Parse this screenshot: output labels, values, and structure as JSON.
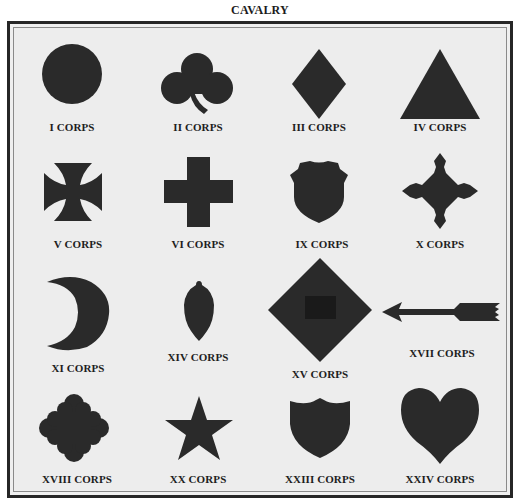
{
  "caption": "CAVALRY",
  "colors": {
    "badge_fill": "#2a2a2a",
    "background": "#ededed",
    "frame": "#262626"
  },
  "badges": [
    {
      "label": "I CORPS",
      "shape": "circle"
    },
    {
      "label": "II CORPS",
      "shape": "trefoil-club"
    },
    {
      "label": "III CORPS",
      "shape": "diamond"
    },
    {
      "label": "IV CORPS",
      "shape": "triangle"
    },
    {
      "label": "V CORPS",
      "shape": "maltese-cross"
    },
    {
      "label": "VI CORPS",
      "shape": "greek-cross"
    },
    {
      "label": "IX CORPS",
      "shape": "shield-badge"
    },
    {
      "label": "X CORPS",
      "shape": "four-pointed-cross"
    },
    {
      "label": "XI CORPS",
      "shape": "crescent"
    },
    {
      "label": "XIV CORPS",
      "shape": "acorn"
    },
    {
      "label": "XV CORPS",
      "shape": "diamond-with-cartridge-box"
    },
    {
      "label": "XVII CORPS",
      "shape": "arrow"
    },
    {
      "label": "XVIII CORPS",
      "shape": "cross-with-foliated-arms"
    },
    {
      "label": "XX CORPS",
      "shape": "star"
    },
    {
      "label": "XXIII CORPS",
      "shape": "shield"
    },
    {
      "label": "XXIV CORPS",
      "shape": "heart"
    }
  ]
}
